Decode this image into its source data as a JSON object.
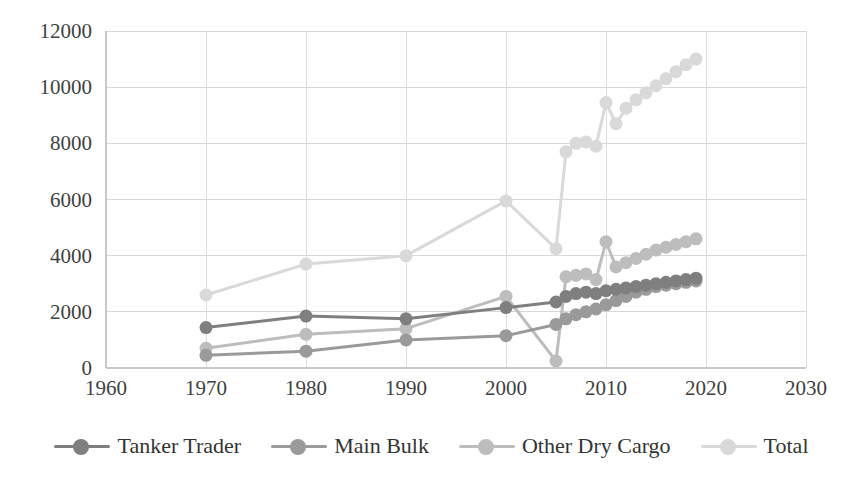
{
  "chart_data": {
    "type": "line",
    "title": "",
    "subtitle": "",
    "xlabel": "",
    "ylabel": "",
    "xlim": [
      1960,
      2030
    ],
    "ylim": [
      0,
      12000
    ],
    "xticks": [
      1960,
      1970,
      1980,
      1990,
      2000,
      2010,
      2020,
      2030
    ],
    "yticks": [
      0,
      2000,
      4000,
      6000,
      8000,
      10000,
      12000
    ],
    "xtick_labels": [
      "1960",
      "1970",
      "1980",
      "1990",
      "2000",
      "2010",
      "2020",
      "2030"
    ],
    "ytick_labels": [
      "0",
      "2000",
      "4000",
      "6000",
      "8000",
      "10000",
      "12000"
    ],
    "grid": "horizontal-and-vertical",
    "legend_position": "bottom",
    "markers": "circle",
    "series": [
      {
        "name": "Tanker Trader",
        "color": "#7f7f7f",
        "x": [
          1970,
          1980,
          1990,
          2000,
          2005,
          2006,
          2007,
          2008,
          2009,
          2010,
          2011,
          2012,
          2013,
          2014,
          2015,
          2016,
          2017,
          2018,
          2019
        ],
        "values": [
          1440,
          1850,
          1750,
          2150,
          2350,
          2550,
          2650,
          2700,
          2650,
          2750,
          2800,
          2850,
          2900,
          2950,
          3000,
          3050,
          3100,
          3150,
          3200
        ]
      },
      {
        "name": "Main Bulk",
        "color": "#9a9a9a",
        "x": [
          1970,
          1980,
          1990,
          2000,
          2005,
          2006,
          2007,
          2008,
          2009,
          2010,
          2011,
          2012,
          2013,
          2014,
          2015,
          2016,
          2017,
          2018,
          2019
        ],
        "values": [
          450,
          600,
          1000,
          1150,
          1550,
          1750,
          1900,
          2000,
          2100,
          2250,
          2400,
          2550,
          2700,
          2800,
          2900,
          2950,
          3000,
          3050,
          3100
        ]
      },
      {
        "name": "Other Dry Cargo",
        "color": "#bdbdbd",
        "x": [
          1970,
          1980,
          1990,
          2000,
          2005,
          2006,
          2007,
          2008,
          2009,
          2010,
          2011,
          2012,
          2013,
          2014,
          2015,
          2016,
          2017,
          2018,
          2019
        ],
        "values": [
          700,
          1200,
          1400,
          2550,
          250,
          3250,
          3300,
          3350,
          3150,
          4500,
          3600,
          3750,
          3900,
          4050,
          4200,
          4300,
          4400,
          4500,
          4600
        ]
      },
      {
        "name": "Total",
        "color": "#d9d9d9",
        "x": [
          1970,
          1980,
          1990,
          2000,
          2005,
          2006,
          2007,
          2008,
          2009,
          2010,
          2011,
          2012,
          2013,
          2014,
          2015,
          2016,
          2017,
          2018,
          2019
        ],
        "values": [
          2600,
          3700,
          4000,
          5950,
          4250,
          7700,
          8000,
          8050,
          7900,
          9450,
          8700,
          9250,
          9550,
          9800,
          10050,
          10300,
          10550,
          10800,
          11000
        ]
      }
    ]
  },
  "legend": {
    "items": [
      {
        "label": "Tanker Trader",
        "color": "#7f7f7f"
      },
      {
        "label": "Main Bulk",
        "color": "#9a9a9a"
      },
      {
        "label": "Other Dry Cargo",
        "color": "#bdbdbd"
      },
      {
        "label": "Total",
        "color": "#d9d9d9"
      }
    ]
  }
}
